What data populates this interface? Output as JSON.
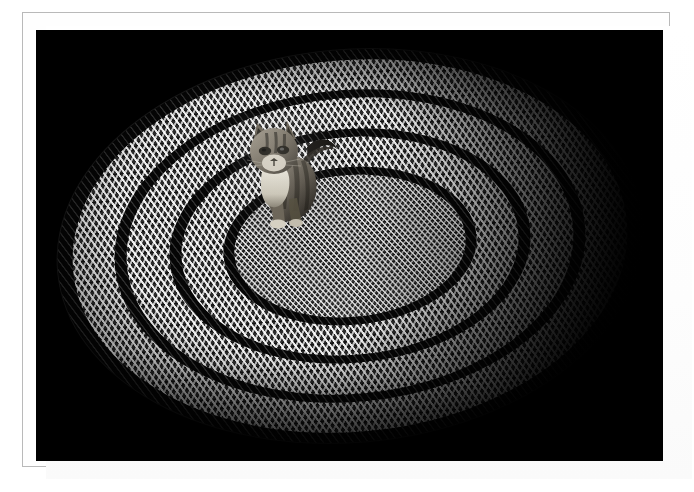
{
  "photo": {
    "title": "Cat on a Braided Oval Rug",
    "subject": "tabby cat",
    "setting": "braided oval rag rug on a dark floor",
    "lighting": "single light from upper left, deep black falloff",
    "presentation": "white photographic mat with thin gray rule",
    "orientation": "landscape",
    "palette": {
      "mat": "#ffffff",
      "mat_rule": "#b9b9b9",
      "photo_background": "#000000",
      "rug_light_braid": "#c8c8c8",
      "rug_mid_braid": "#7a7a7a",
      "rug_dark_braid": "#060606",
      "cat_fur": "#8d8578",
      "cat_bib": "#e6e2d8"
    }
  },
  "frame": {
    "border_label": "mat-rule",
    "mat_label": "white-mat"
  },
  "rug": {
    "label": "braided-oval-rug",
    "shape": "oval",
    "weave": "chevron braid",
    "bands": [
      {
        "name": "outer-dark-edge",
        "tone": "dark",
        "rx": 293,
        "ry": 196
      },
      {
        "name": "outer-light-band",
        "tone": "light",
        "rx": 278,
        "ry": 186
      },
      {
        "name": "ring-dark-1",
        "tone": "dark",
        "rx": 236,
        "ry": 156
      },
      {
        "name": "ring-light-2",
        "tone": "light",
        "rx": 224,
        "ry": 148
      },
      {
        "name": "ring-dark-2",
        "tone": "dark",
        "rx": 181,
        "ry": 117
      },
      {
        "name": "ring-light-3",
        "tone": "light",
        "rx": 169,
        "ry": 109
      },
      {
        "name": "ring-dark-3",
        "tone": "dark",
        "rx": 127,
        "ry": 79
      },
      {
        "name": "center-field",
        "tone": "light",
        "rx": 116,
        "ry": 71
      }
    ]
  },
  "cat": {
    "label": "tabby-cat",
    "pose": "sitting, facing camera",
    "features": [
      "striped tabby head",
      "upright ears",
      "white chest bib",
      "tail curved to the right"
    ],
    "position": {
      "x": 196,
      "y": 82
    }
  }
}
